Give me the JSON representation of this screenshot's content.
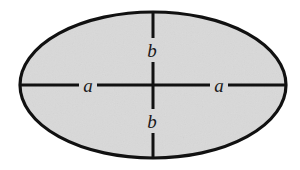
{
  "figure": {
    "kind": "geometry-diagram",
    "shape": "ellipse",
    "canvas": {
      "width": 300,
      "height": 170
    },
    "background_color": "#ffffff"
  },
  "ellipse": {
    "center_x": 153,
    "center_y": 85,
    "semi_major_x": 133,
    "semi_minor_y": 73,
    "fill_color": "#d9d9d9",
    "stroke_color": "#111111",
    "stroke_width": 3.2
  },
  "axes": {
    "line_color": "#111111",
    "line_width": 3.0,
    "horizontal": {
      "name": "major-axis",
      "x1": 20,
      "x2": 286,
      "y": 85
    },
    "vertical": {
      "name": "minor-axis",
      "y1": 12,
      "y2": 158,
      "x": 153
    }
  },
  "labels": {
    "font_size": 19,
    "color": "#1a1a1a",
    "left_a": {
      "text": "a",
      "x": 88,
      "y": 85,
      "gap": 18
    },
    "right_a": {
      "text": "a",
      "x": 219,
      "y": 85,
      "gap": 18
    },
    "top_b": {
      "text": "b",
      "x": 152,
      "y": 50,
      "gap": 24
    },
    "bottom_b": {
      "text": "b",
      "x": 152,
      "y": 121,
      "gap": 24
    }
  }
}
